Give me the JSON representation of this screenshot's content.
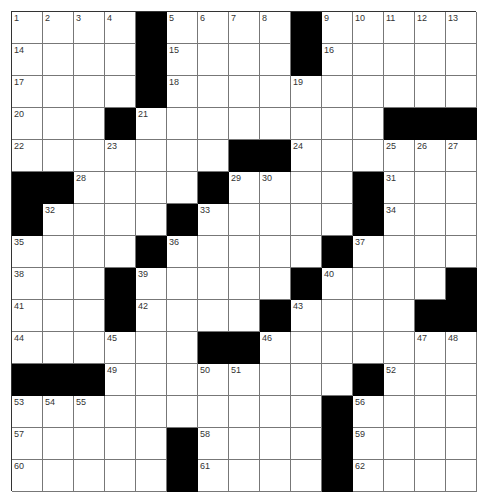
{
  "puzzle": {
    "rows": 15,
    "cols": 15,
    "layout": [
      "....#....#.....",
      "....#....#.....",
      "....#..........",
      "...#........###",
      ".......##......",
      "##....#....#...",
      "#....#.....#...",
      "....#.....#....",
      "...#.....#....#",
      "...#....#....##",
      "......##.......",
      "###........#...",
      "..........#....",
      ".....#....#....",
      ".....#....#...."
    ],
    "numbers": [
      {
        "r": 0,
        "c": 0,
        "n": "1"
      },
      {
        "r": 0,
        "c": 1,
        "n": "2"
      },
      {
        "r": 0,
        "c": 2,
        "n": "3"
      },
      {
        "r": 0,
        "c": 3,
        "n": "4"
      },
      {
        "r": 0,
        "c": 5,
        "n": "5"
      },
      {
        "r": 0,
        "c": 6,
        "n": "6"
      },
      {
        "r": 0,
        "c": 7,
        "n": "7"
      },
      {
        "r": 0,
        "c": 8,
        "n": "8"
      },
      {
        "r": 0,
        "c": 10,
        "n": "9"
      },
      {
        "r": 0,
        "c": 11,
        "n": "10"
      },
      {
        "r": 0,
        "c": 12,
        "n": "11"
      },
      {
        "r": 0,
        "c": 13,
        "n": "12"
      },
      {
        "r": 0,
        "c": 14,
        "n": "13"
      },
      {
        "r": 1,
        "c": 0,
        "n": "14"
      },
      {
        "r": 1,
        "c": 5,
        "n": "15"
      },
      {
        "r": 1,
        "c": 10,
        "n": "16"
      },
      {
        "r": 2,
        "c": 0,
        "n": "17"
      },
      {
        "r": 2,
        "c": 5,
        "n": "18"
      },
      {
        "r": 2,
        "c": 9,
        "n": "19"
      },
      {
        "r": 3,
        "c": 0,
        "n": "20"
      },
      {
        "r": 3,
        "c": 4,
        "n": "21"
      },
      {
        "r": 4,
        "c": 0,
        "n": "22"
      },
      {
        "r": 4,
        "c": 3,
        "n": "23"
      },
      {
        "r": 4,
        "c": 9,
        "n": "24"
      },
      {
        "r": 4,
        "c": 12,
        "n": "25"
      },
      {
        "r": 4,
        "c": 13,
        "n": "26"
      },
      {
        "r": 4,
        "c": 14,
        "n": "27"
      },
      {
        "r": 5,
        "c": 2,
        "n": "28"
      },
      {
        "r": 5,
        "c": 7,
        "n": "29"
      },
      {
        "r": 5,
        "c": 8,
        "n": "30"
      },
      {
        "r": 5,
        "c": 12,
        "n": "31"
      },
      {
        "r": 6,
        "c": 1,
        "n": "32"
      },
      {
        "r": 6,
        "c": 6,
        "n": "33"
      },
      {
        "r": 6,
        "c": 12,
        "n": "34"
      },
      {
        "r": 7,
        "c": 0,
        "n": "35"
      },
      {
        "r": 7,
        "c": 5,
        "n": "36"
      },
      {
        "r": 7,
        "c": 11,
        "n": "37"
      },
      {
        "r": 8,
        "c": 0,
        "n": "38"
      },
      {
        "r": 8,
        "c": 4,
        "n": "39"
      },
      {
        "r": 8,
        "c": 10,
        "n": "40"
      },
      {
        "r": 9,
        "c": 0,
        "n": "41"
      },
      {
        "r": 9,
        "c": 4,
        "n": "42"
      },
      {
        "r": 9,
        "c": 9,
        "n": "43"
      },
      {
        "r": 10,
        "c": 0,
        "n": "44"
      },
      {
        "r": 10,
        "c": 3,
        "n": "45"
      },
      {
        "r": 10,
        "c": 8,
        "n": "46"
      },
      {
        "r": 10,
        "c": 13,
        "n": "47"
      },
      {
        "r": 10,
        "c": 14,
        "n": "48"
      },
      {
        "r": 11,
        "c": 3,
        "n": "49"
      },
      {
        "r": 11,
        "c": 6,
        "n": "50"
      },
      {
        "r": 11,
        "c": 7,
        "n": "51"
      },
      {
        "r": 11,
        "c": 12,
        "n": "52"
      },
      {
        "r": 12,
        "c": 0,
        "n": "53"
      },
      {
        "r": 12,
        "c": 1,
        "n": "54"
      },
      {
        "r": 12,
        "c": 2,
        "n": "55"
      },
      {
        "r": 12,
        "c": 11,
        "n": "56"
      },
      {
        "r": 13,
        "c": 0,
        "n": "57"
      },
      {
        "r": 13,
        "c": 6,
        "n": "58"
      },
      {
        "r": 13,
        "c": 11,
        "n": "59"
      },
      {
        "r": 14,
        "c": 0,
        "n": "60"
      },
      {
        "r": 14,
        "c": 6,
        "n": "61"
      },
      {
        "r": 14,
        "c": 11,
        "n": "62"
      }
    ],
    "colors": {
      "block": "#000000",
      "cell": "#ffffff",
      "line": "#777777",
      "number": "#333333"
    }
  }
}
